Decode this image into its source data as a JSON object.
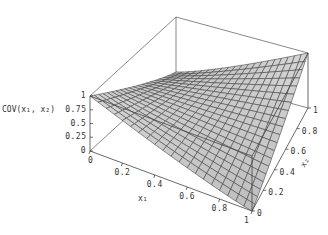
{
  "chart_data": {
    "type": "surface3d",
    "title": "",
    "zlabel": "COV(x1, x2)",
    "xlabel": "x1",
    "ylabel": "x2",
    "x_ticks": [
      "0",
      "0.2",
      "0.4",
      "0.6",
      "0.8",
      "1"
    ],
    "y_ticks": [
      "0",
      "0.2",
      "0.4",
      "0.6",
      "0.8",
      "1"
    ],
    "z_ticks": [
      "0",
      "0.25",
      "0.5",
      "0.75",
      "1"
    ],
    "xlim": [
      0,
      1
    ],
    "ylim": [
      0,
      1
    ],
    "zlim": [
      0,
      1
    ],
    "grid_resolution": 20,
    "surface_color": "#c8c8c8",
    "mesh_color": "#444444",
    "box": true,
    "corner_values": {
      "x1=0,x2=0": 1,
      "x1=1,x2=1": 1,
      "x1=1,x2=0": 0,
      "x1=0,x2=1": 0
    }
  },
  "labels": {
    "zlabel": "COV(x₁, x₂)",
    "xlabel": "x₁",
    "ylabel": "x₂"
  }
}
